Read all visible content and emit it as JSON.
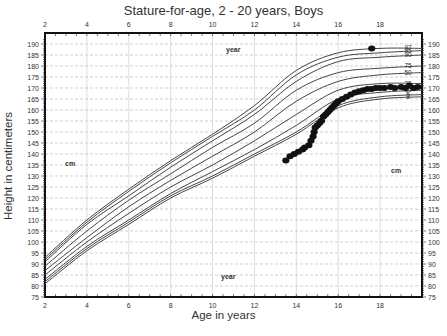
{
  "chart_data": {
    "type": "line",
    "title": "Stature-for-age, 2 - 20 years, Boys",
    "xlabel": "Age in years",
    "ylabel": "Height in centimeters",
    "xlim": [
      2,
      20
    ],
    "ylim": [
      75,
      190
    ],
    "x_ticks": [
      2,
      4,
      6,
      8,
      10,
      12,
      14,
      16,
      18
    ],
    "y_ticks": [
      75,
      80,
      85,
      90,
      95,
      100,
      105,
      110,
      115,
      120,
      125,
      130,
      135,
      140,
      145,
      150,
      155,
      160,
      165,
      170,
      175,
      180,
      185,
      190
    ],
    "grid": true,
    "annotations": [
      "year",
      "year",
      "cm",
      "cm"
    ],
    "percentile_labels": [
      "97",
      "95",
      "90",
      "75",
      "50",
      "25",
      "10",
      "5",
      "3"
    ],
    "x": [
      2,
      4,
      6,
      8,
      10,
      12,
      14,
      16,
      18,
      20
    ],
    "series": [
      {
        "name": "97",
        "values": [
          93,
          110,
          124,
          137,
          149,
          162,
          178,
          186,
          188,
          188
        ]
      },
      {
        "name": "95",
        "values": [
          92,
          109,
          123,
          136,
          148,
          160,
          176,
          184,
          186,
          187
        ]
      },
      {
        "name": "90",
        "values": [
          91,
          108,
          121,
          134,
          146,
          158,
          173,
          182,
          184,
          185
        ]
      },
      {
        "name": "75",
        "values": [
          89,
          105,
          119,
          131,
          143,
          154,
          169,
          177,
          179,
          180
        ]
      },
      {
        "name": "50",
        "values": [
          87,
          102,
          116,
          128,
          139,
          150,
          164,
          173,
          176,
          177
        ]
      },
      {
        "name": "25",
        "values": [
          85,
          100,
          113,
          125,
          135,
          146,
          158,
          169,
          172,
          172
        ]
      },
      {
        "name": "10",
        "values": [
          83,
          98,
          110,
          122,
          132,
          142,
          153,
          165,
          168,
          169
        ]
      },
      {
        "name": "5",
        "values": [
          82,
          97,
          109,
          121,
          130,
          140,
          150,
          162,
          166,
          167
        ]
      },
      {
        "name": "3",
        "values": [
          81,
          96,
          108,
          120,
          129,
          139,
          149,
          161,
          165,
          166
        ]
      }
    ],
    "scatter": {
      "name": "measurements",
      "points": [
        [
          13.5,
          137
        ],
        [
          13.7,
          139
        ],
        [
          13.9,
          140
        ],
        [
          14.1,
          141
        ],
        [
          14.3,
          142
        ],
        [
          14.4,
          143
        ],
        [
          14.6,
          144
        ],
        [
          14.7,
          146
        ],
        [
          14.8,
          148
        ],
        [
          14.85,
          150
        ],
        [
          14.9,
          152
        ],
        [
          15.0,
          153
        ],
        [
          15.1,
          154
        ],
        [
          15.2,
          155
        ],
        [
          15.3,
          157
        ],
        [
          15.4,
          158
        ],
        [
          15.5,
          159
        ],
        [
          15.6,
          160
        ],
        [
          15.7,
          161
        ],
        [
          15.8,
          162
        ],
        [
          15.9,
          163
        ],
        [
          16.0,
          164
        ],
        [
          16.2,
          165
        ],
        [
          16.4,
          166
        ],
        [
          16.6,
          167
        ],
        [
          16.8,
          168
        ],
        [
          17.0,
          168.5
        ],
        [
          17.2,
          169
        ],
        [
          17.4,
          169.5
        ],
        [
          17.6,
          169.5
        ],
        [
          17.8,
          170
        ],
        [
          18.0,
          170
        ],
        [
          18.2,
          170
        ],
        [
          18.5,
          170.5
        ],
        [
          18.7,
          170
        ],
        [
          19.0,
          170.5
        ],
        [
          19.2,
          170
        ],
        [
          19.4,
          171
        ],
        [
          19.6,
          170
        ],
        [
          19.8,
          170.5
        ],
        [
          17.6,
          188
        ]
      ]
    }
  },
  "labels": {
    "title": "Stature-for-age, 2 - 20 years, Boys",
    "xlabel": "Age in years",
    "ylabel": "Height in centimeters",
    "year_top": "year",
    "year_bottom": "year",
    "cm_left": "cm",
    "cm_right": "cm"
  },
  "colors": {
    "curve": "#444444",
    "point": "#111111",
    "grid": "#bbbbbb",
    "frame": "#111111"
  }
}
